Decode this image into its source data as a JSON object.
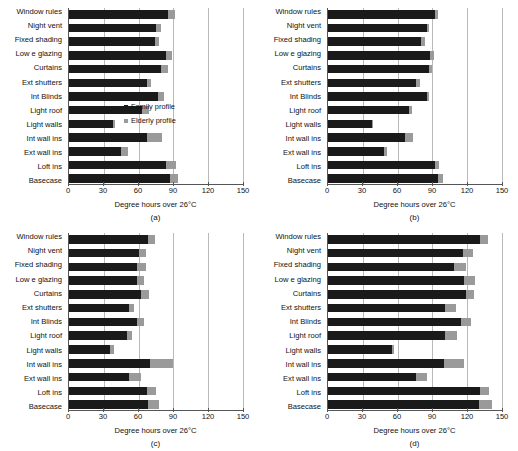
{
  "figure": {
    "categories": [
      "Window rules",
      "Night vent",
      "Fixed shading",
      "Low e glazing",
      "Curtains",
      "Ext shutters",
      "Int Blinds",
      "Light roof",
      "Light walls",
      "Int wall ins",
      "Ext wall ins",
      "Loft ins",
      "Basecase"
    ],
    "xlabel": "Degree hours over 26°C",
    "xticks": [
      "0",
      "30",
      "60",
      "90",
      "120",
      "150"
    ],
    "legend": {
      "family": "Family profile",
      "elderly": "Elderly profile"
    },
    "colors": {
      "family": "#1a1a1a",
      "elderly": "#9a9a9a",
      "grid": "#b9b9b9",
      "axis": "#555555"
    }
  },
  "chart_data": [
    {
      "type": "bar",
      "orientation": "horizontal",
      "panel": "(a)",
      "title": "",
      "xlabel": "Degree hours over 26°C",
      "ylabel": "",
      "xlim": [
        0,
        150
      ],
      "xticks": [
        0,
        30,
        60,
        90,
        120,
        150
      ],
      "grid": true,
      "legend_position": "inside-right",
      "categories": [
        "Window rules",
        "Night vent",
        "Fixed shading",
        "Low e glazing",
        "Curtains",
        "Ext shutters",
        "Int Blinds",
        "Light roof",
        "Light walls",
        "Int wall ins",
        "Ext wall ins",
        "Loft ins",
        "Basecase"
      ],
      "series": [
        {
          "name": "Family profile",
          "values": [
            85,
            75,
            74,
            84,
            79,
            67,
            77,
            63,
            38,
            67,
            45,
            84,
            87
          ]
        },
        {
          "name": "Elderly profile",
          "values": [
            91,
            79,
            78,
            89,
            85,
            71,
            82,
            69,
            40,
            80,
            51,
            92,
            94
          ]
        }
      ]
    },
    {
      "type": "bar",
      "orientation": "horizontal",
      "panel": "(b)",
      "title": "",
      "xlabel": "Degree hours over 26°C",
      "ylabel": "",
      "xlim": [
        0,
        150
      ],
      "xticks": [
        0,
        30,
        60,
        90,
        120,
        150
      ],
      "grid": true,
      "legend_position": "none",
      "categories": [
        "Window rules",
        "Night vent",
        "Fixed shading",
        "Low e glazing",
        "Curtains",
        "Ext shutters",
        "Int Blinds",
        "Light roof",
        "Light walls",
        "Int wall ins",
        "Ext wall ins",
        "Loft ins",
        "Basecase"
      ],
      "series": [
        {
          "name": "Family profile",
          "values": [
            92,
            85,
            80,
            88,
            87,
            76,
            85,
            70,
            38,
            66,
            48,
            92,
            95
          ]
        },
        {
          "name": "Elderly profile",
          "values": [
            95,
            87,
            84,
            91,
            90,
            79,
            87,
            72,
            39,
            73,
            51,
            96,
            99
          ]
        }
      ]
    },
    {
      "type": "bar",
      "orientation": "horizontal",
      "panel": "(c)",
      "title": "",
      "xlabel": "Degree hours over 26°C",
      "ylabel": "",
      "xlim": [
        0,
        150
      ],
      "xticks": [
        0,
        30,
        60,
        90,
        120,
        150
      ],
      "grid": true,
      "legend_position": "none",
      "categories": [
        "Window rules",
        "Night vent",
        "Fixed shading",
        "Low e glazing",
        "Curtains",
        "Ext shutters",
        "Int Blinds",
        "Light roof",
        "Light walls",
        "Int wall ins",
        "Ext wall ins",
        "Loft ins",
        "Basecase"
      ],
      "series": [
        {
          "name": "Family profile",
          "values": [
            68,
            60,
            59,
            59,
            62,
            52,
            59,
            50,
            35,
            70,
            52,
            67,
            68
          ]
        },
        {
          "name": "Elderly profile",
          "values": [
            74,
            66,
            66,
            65,
            69,
            56,
            65,
            54,
            39,
            90,
            62,
            75,
            78
          ]
        }
      ]
    },
    {
      "type": "bar",
      "orientation": "horizontal",
      "panel": "(d)",
      "title": "",
      "xlabel": "Degree hours over 26°C",
      "ylabel": "",
      "xlim": [
        0,
        150
      ],
      "xticks": [
        0,
        30,
        60,
        90,
        120,
        150
      ],
      "grid": true,
      "legend_position": "none",
      "categories": [
        "Window rules",
        "Night vent",
        "Fixed shading",
        "Low e glazing",
        "Curtains",
        "Ext shutters",
        "Int Blinds",
        "Light roof",
        "Light walls",
        "Int wall ins",
        "Ext wall ins",
        "Loft ins",
        "Basecase"
      ],
      "series": [
        {
          "name": "Family profile",
          "values": [
            131,
            116,
            109,
            117,
            119,
            101,
            115,
            101,
            55,
            100,
            76,
            131,
            130
          ]
        },
        {
          "name": "Elderly profile",
          "values": [
            138,
            125,
            119,
            127,
            126,
            110,
            123,
            111,
            57,
            117,
            85,
            139,
            141
          ]
        }
      ]
    }
  ]
}
